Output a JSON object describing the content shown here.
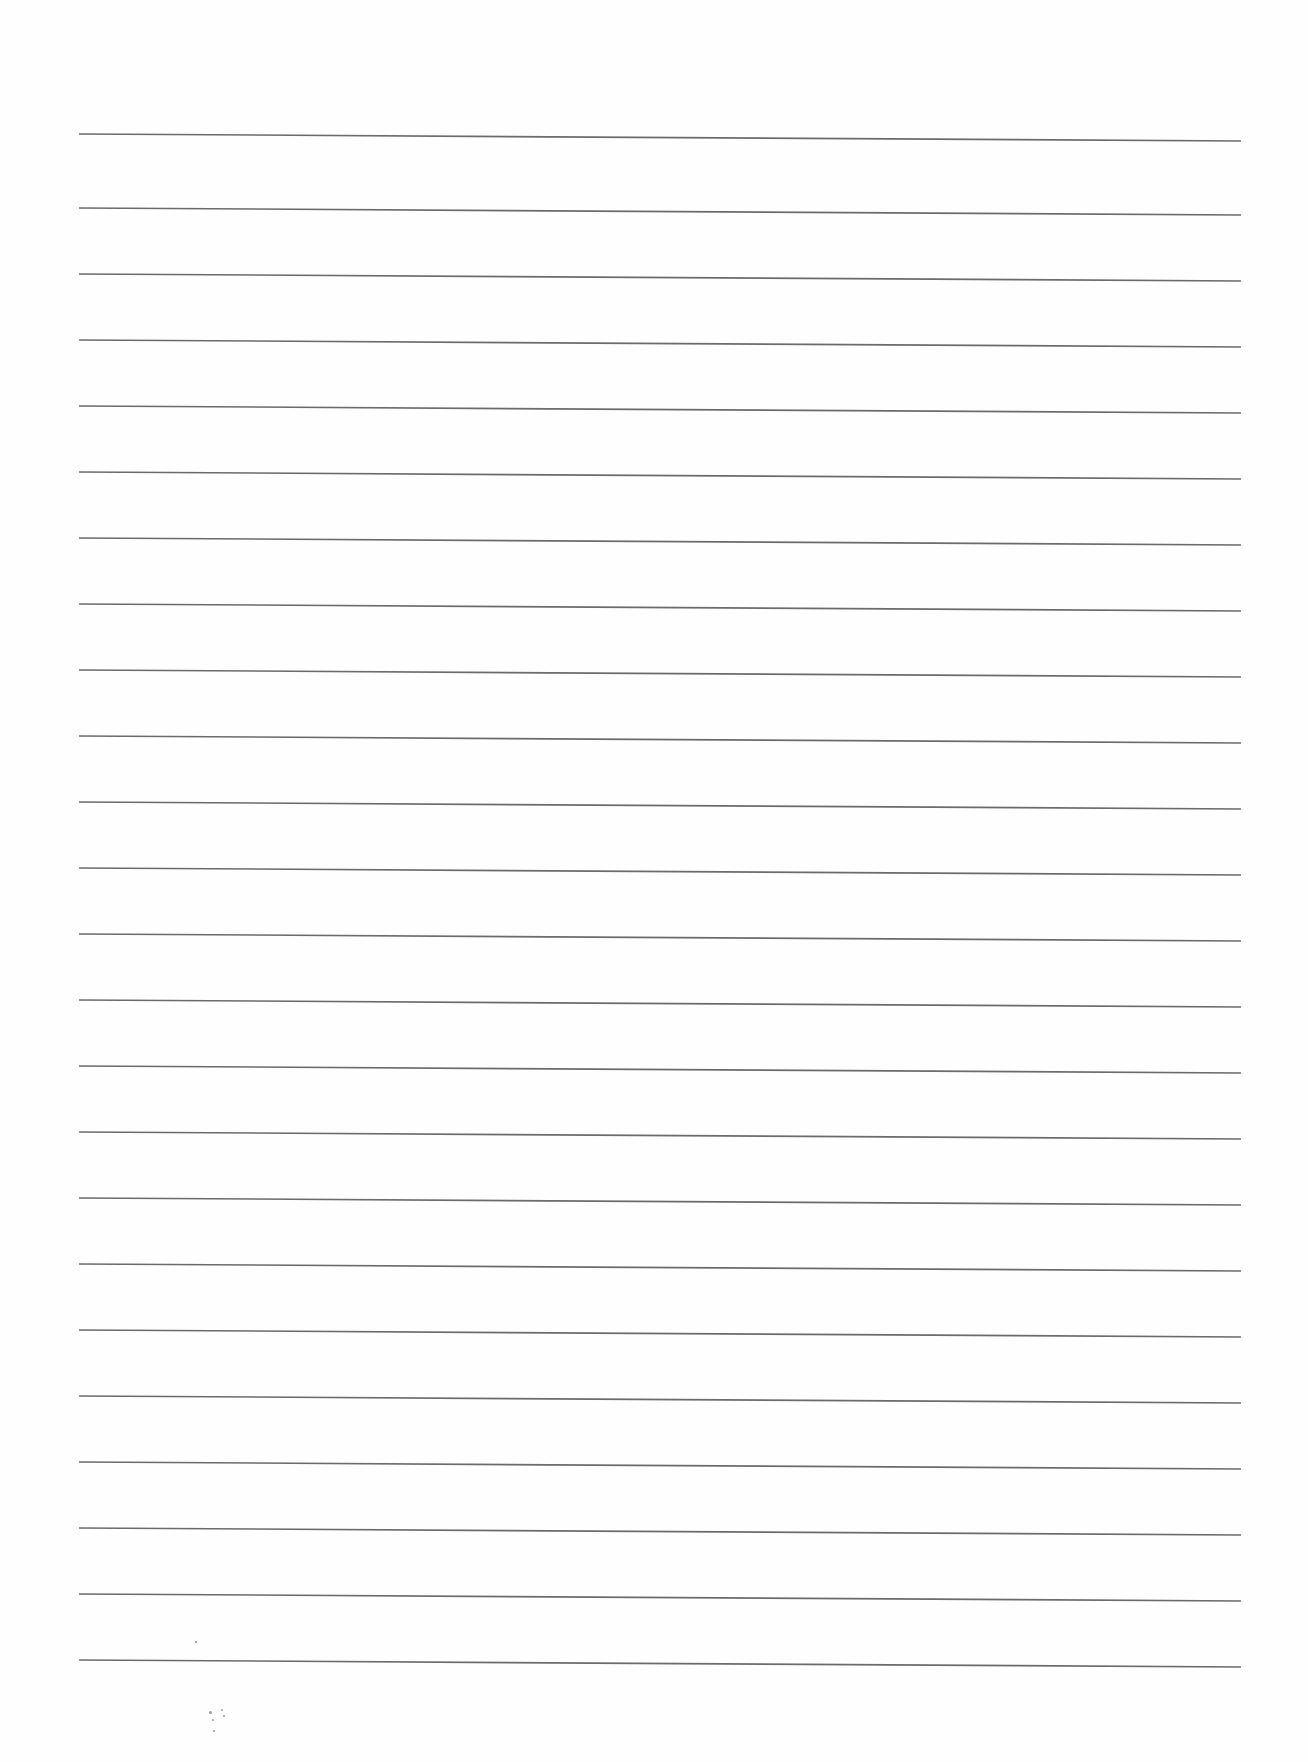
{
  "sheet": {
    "type": "lined-paper",
    "background_color": "#fefefe",
    "line_color": "#6b6b6b",
    "line_count": 24,
    "line_left_x": 79,
    "line_right_x": 1241,
    "right_edge_drop_px": 7,
    "line_y_left": [
      134,
      208,
      274,
      340,
      406,
      472,
      538,
      604,
      670,
      736,
      802,
      868,
      934,
      1000,
      1066,
      1132,
      1198,
      1264,
      1330,
      1396,
      1462,
      1528,
      1594,
      1660
    ],
    "text_content": ""
  },
  "marks": [
    {
      "x": 210,
      "y": 1712,
      "r": 1.5
    },
    {
      "x": 213,
      "y": 1720,
      "r": 1.2
    },
    {
      "x": 222,
      "y": 1710,
      "r": 1.0
    },
    {
      "x": 224,
      "y": 1716,
      "r": 1.2
    },
    {
      "x": 214,
      "y": 1731,
      "r": 1.4
    },
    {
      "x": 196,
      "y": 1642,
      "r": 0.8
    }
  ]
}
